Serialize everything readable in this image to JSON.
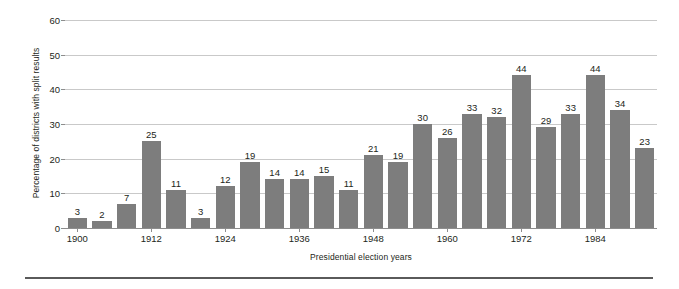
{
  "chart_data": {
    "type": "bar",
    "title": "",
    "subtitle": "",
    "xlabel": "Presidential election years",
    "ylabel": "Percentage of districts with split results",
    "ylim": [
      0,
      60
    ],
    "yticks": [
      0,
      10,
      20,
      30,
      40,
      50,
      60
    ],
    "grid": true,
    "legend": null,
    "bar_color": "#7d7d7d",
    "gridline_color": "#c9c9c9",
    "axis_color": "#8d8d8d",
    "text_color": "#231f20",
    "categories": [
      "1900",
      "1904",
      "1908",
      "1912",
      "1916",
      "1920",
      "1924",
      "1928",
      "1932",
      "1936",
      "1940",
      "1944",
      "1948",
      "1952",
      "1956",
      "1960",
      "1964",
      "1968",
      "1972",
      "1976",
      "1980",
      "1984",
      "1988",
      "1992"
    ],
    "xtick_labels": [
      "1900",
      "1912",
      "1924",
      "1936",
      "1948",
      "1960",
      "1972",
      "1984"
    ],
    "xtick_indices": [
      0,
      3,
      6,
      9,
      12,
      15,
      18,
      21
    ],
    "values": [
      3,
      2,
      7,
      25,
      11,
      3,
      12,
      19,
      14,
      14,
      15,
      11,
      21,
      19,
      30,
      26,
      33,
      32,
      44,
      29,
      33,
      44,
      34,
      23
    ],
    "value_labels": [
      "3",
      "2",
      "7",
      "25",
      "11",
      "3",
      "12",
      "19",
      "14",
      "14",
      "15",
      "11",
      "21",
      "19",
      "30",
      "26",
      "33",
      "32",
      "44",
      "29",
      "33",
      "44",
      "34",
      "23"
    ]
  }
}
